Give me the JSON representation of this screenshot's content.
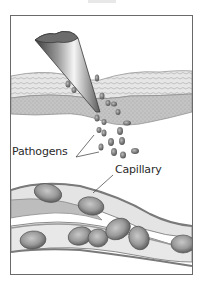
{
  "figure": {
    "labels": {
      "pathogens": "Pathogens",
      "capillary": "Capillary"
    },
    "colors": {
      "frame": "#6a6a6a",
      "skin_outer": "#d9d9d9",
      "skin_inner": "#bdbdbd",
      "needle_dark": "#4a4a4a",
      "needle_light": "#f2f2f2",
      "pathogen": "#7a7a7a",
      "cell": "#9a9a9a",
      "vessel_wall": "#8c8c8c"
    }
  }
}
